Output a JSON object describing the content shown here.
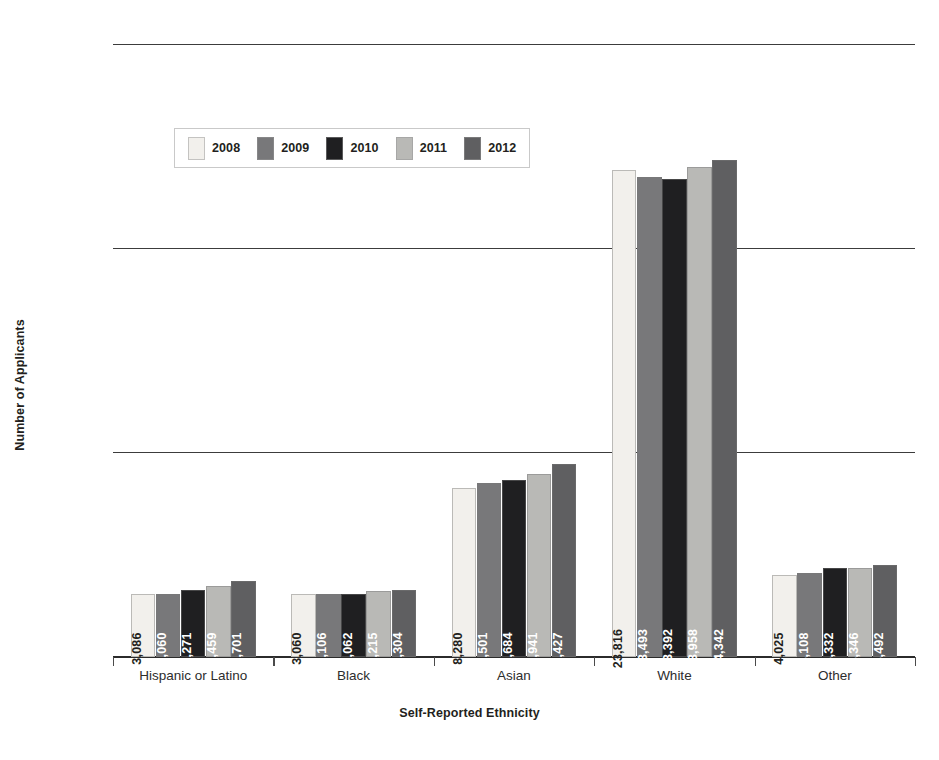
{
  "chart_data": {
    "type": "bar",
    "title": "",
    "xlabel": "Self-Reported Ethnicity",
    "ylabel": "Number of Applicants",
    "categories": [
      "Hispanic or Latino",
      "Black",
      "Asian",
      "White",
      "Other"
    ],
    "ylim": [
      0,
      30000
    ],
    "yticks": [
      0,
      10000,
      20000,
      30000
    ],
    "ytick_labels": [
      "0",
      "10,000",
      "20,000",
      "30,000"
    ],
    "grid": true,
    "legend_position": "upper-left-inside",
    "series": [
      {
        "name": "2008",
        "color": "#f2f0ec",
        "label_color": "dark",
        "values": [
          3086,
          3060,
          8280,
          23816,
          4025
        ],
        "value_labels": [
          "3,086",
          "3,060",
          "8,280",
          "23,816",
          "4,025"
        ]
      },
      {
        "name": "2009",
        "color": "#78787a",
        "label_color": "light",
        "values": [
          3060,
          3106,
          8501,
          23493,
          4108
        ],
        "value_labels": [
          "3,060",
          "3,106",
          "8,501",
          "23,493",
          "4,108"
        ]
      },
      {
        "name": "2010",
        "color": "#1f1f21",
        "label_color": "light",
        "values": [
          3271,
          3062,
          8684,
          23392,
          4332
        ],
        "value_labels": [
          "3,271",
          "3,062",
          "8,684",
          "23,392",
          "4,332"
        ]
      },
      {
        "name": "2011",
        "color": "#b9b9b6",
        "label_color": "light",
        "values": [
          3459,
          3215,
          8941,
          23958,
          4346
        ],
        "value_labels": [
          "3,459",
          "3,215",
          "8,941",
          "23,958",
          "4,346"
        ]
      },
      {
        "name": "2012",
        "color": "#5f5f61",
        "label_color": "light",
        "values": [
          3701,
          3304,
          9427,
          24342,
          4492
        ],
        "value_labels": [
          "3,701",
          "3,304",
          "9,427",
          "24,342",
          "4,492"
        ]
      }
    ]
  }
}
